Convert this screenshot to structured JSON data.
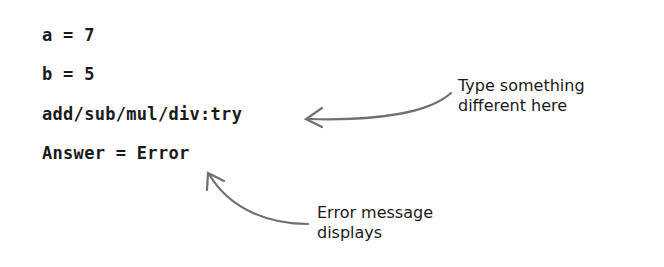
{
  "code_lines": {
    "line_a": "a = 7",
    "line_b": "b = 5",
    "line_prompt": "add/sub/mul/div:try",
    "line_answer": "Answer = Error"
  },
  "annotations": {
    "prompt_note": {
      "line1": "Type something",
      "line2": "different here"
    },
    "error_note": {
      "line1": "Error message",
      "line2": "displays"
    }
  },
  "colors": {
    "text": "#1a1a1a",
    "arrow": "#707070",
    "background": "#ffffff"
  }
}
